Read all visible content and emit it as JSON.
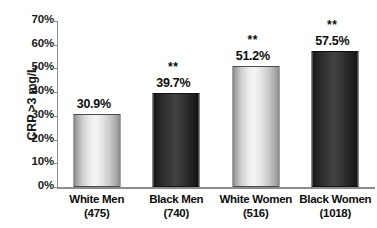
{
  "chart_data": {
    "type": "bar",
    "title": "",
    "xlabel": "",
    "ylabel": "CRP >3 mg/L",
    "ylim": [
      0,
      70
    ],
    "ytick_labels": [
      "70%",
      "60%",
      "50%",
      "40%",
      "30%",
      "20%",
      "10%",
      "0%"
    ],
    "ytick_values": [
      70,
      60,
      50,
      40,
      30,
      20,
      10,
      0
    ],
    "grid": false,
    "legend": "none",
    "categories": [
      "White Men",
      "Black Men",
      "White Women",
      "Black Women"
    ],
    "group_sizes": [
      "(475)",
      "(740)",
      "(516)",
      "(1018)"
    ],
    "values": [
      30.9,
      39.7,
      51.2,
      57.5
    ],
    "value_labels": [
      "30.9%",
      "39.7%",
      "51.2%",
      "57.5%"
    ],
    "significance": [
      "",
      "**",
      "**",
      "**"
    ],
    "bar_styles": [
      "light",
      "dark",
      "light",
      "dark"
    ],
    "colors": {
      "light_bar": "#dcdcdc",
      "dark_bar": "#2b2b2b",
      "axis": "#8c8c8c",
      "text": "#0d0d0d",
      "background": "#ffffff"
    }
  }
}
